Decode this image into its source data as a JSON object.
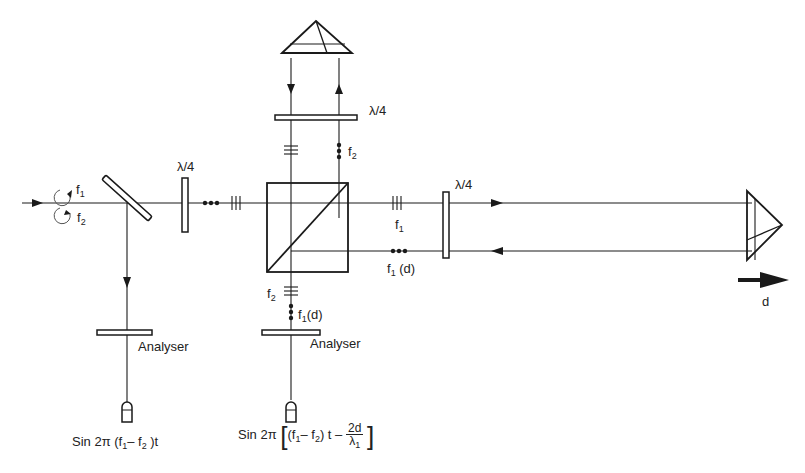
{
  "diagram": {
    "type": "heterodyne laser interferometer schematic",
    "input_beam": {
      "labels": [
        {
          "id": "f1",
          "text": "f",
          "sub": "1"
        },
        {
          "id": "f2",
          "text": "f",
          "sub": "2"
        }
      ]
    },
    "wave_plates": {
      "left": {
        "label": "λ/4"
      },
      "top": {
        "label": "λ/4"
      },
      "right": {
        "label": "λ/4"
      }
    },
    "beam_labels": {
      "top_f2": {
        "text": "f",
        "sub": "2"
      },
      "right_f1": {
        "text": "f",
        "sub": "1"
      },
      "right_f1d": {
        "text": "f",
        "sub": "1",
        "suffix": " (d)"
      },
      "bottom_f2": {
        "text": "f",
        "sub": "2"
      },
      "bottom_f1d": {
        "text": "f",
        "sub": "1",
        "suffix": "(d)"
      }
    },
    "analysers": {
      "left": {
        "label": "Analyser"
      },
      "center": {
        "label": "Analyser"
      }
    },
    "displacement": {
      "label": "d"
    },
    "outputs": {
      "reference": {
        "prefix": "Sin 2π (f",
        "sub1": "1",
        "mid": "– f",
        "sub2": "2",
        "suffix": " )t"
      },
      "measurement": {
        "prefix": "Sin 2π",
        "bracket_open": "[",
        "inner_a": "(f",
        "sub1": "1",
        "inner_b": "– f",
        "sub2": "2",
        "inner_c": ") t –",
        "frac_num": "2d",
        "frac_den": "λ",
        "frac_den_sub": "1",
        "bracket_close": "]"
      }
    }
  }
}
